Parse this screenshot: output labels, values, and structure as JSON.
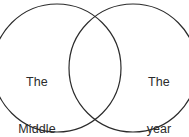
{
  "figure": {
    "type": "venn-diagram",
    "background_color": "#ffffff",
    "stroke_color": "#2b2b2b",
    "text_color": "#2b2b2b"
  },
  "sets": {
    "left": {
      "name": "left-set",
      "lines": [
        "The",
        "Middle",
        "Ages"
      ],
      "line1": "The",
      "line2": "Middle",
      "line3": "Ages",
      "center_x": 57,
      "center_y": 68,
      "radius": 64
    },
    "right": {
      "name": "right-set",
      "lines": [
        "The",
        "year",
        "2000"
      ],
      "line1": "The",
      "line2": "year",
      "line3": "2000",
      "center_x": 133,
      "center_y": 68,
      "radius": 64
    },
    "intersection": {
      "name": "intersection-region",
      "label": ""
    }
  }
}
